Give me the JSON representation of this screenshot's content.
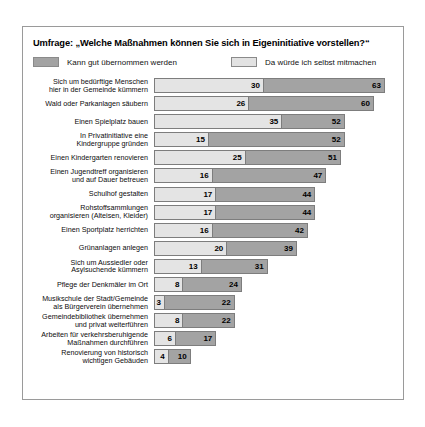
{
  "chart": {
    "title": "Umfrage: „Welche Maßnahmen können Sie sich in Eigeninitiative vorstellen?“",
    "legend": [
      {
        "label": "Kann gut übernommen werden",
        "swatch": "dark",
        "color": "#a3a3a3"
      },
      {
        "label": "Da würde ich selbst mitmachen",
        "swatch": "light",
        "color": "#e4e4e4"
      }
    ]
  },
  "chart_data": {
    "type": "bar",
    "orientation": "horizontal",
    "overlay": true,
    "title": "Umfrage: „Welche Maßnahmen können Sie sich in Eigeninitiative vorstellen?“",
    "xlabel": "",
    "ylabel": "",
    "xlim": [
      0,
      63
    ],
    "grid": false,
    "legend_position": "top",
    "categories": [
      "Sich um bedürftige Menschen hier in der Gemeinde kümmern",
      "Wald oder Parkanlagen säubern",
      "Einen Spielplatz bauen",
      "In Privatinitiative eine Kindergruppe gründen",
      "Einen Kindergarten renovieren",
      "Einen Jugendtreff organisieren und auf Dauer betreuen",
      "Schulhof gestalten",
      "Rohstoffsammlungen organisieren (Alteisen, Kleider)",
      "Einen Sportplatz herrichten",
      "Grünanlagen anlegen",
      "Sich um Aussiedler oder Asylsuchende kümmern",
      "Pflege der Denkmäler im Ort",
      "Musikschule der Stadt/Gemeinde als Bürgerverein übernehmen",
      "Gemeindebibliothek übernehmen und privat weiterführen",
      "Arbeiten für verkehrsberuhigende Maßnahmen durchführen",
      "Renovierung von historisch wichtigen Gebäuden"
    ],
    "series": [
      {
        "name": "Kann gut übernommen werden",
        "color": "#a3a3a3",
        "values": [
          63,
          60,
          52,
          52,
          51,
          47,
          44,
          44,
          42,
          39,
          31,
          24,
          22,
          22,
          17,
          10
        ]
      },
      {
        "name": "Da würde ich selbst mitmachen",
        "color": "#e4e4e4",
        "values": [
          30,
          26,
          35,
          15,
          25,
          16,
          17,
          17,
          16,
          20,
          13,
          8,
          3,
          8,
          6,
          4
        ]
      }
    ],
    "rows": [
      {
        "label_lines": [
          "Sich um bedürftige Menschen",
          "hier in der Gemeinde kümmern"
        ],
        "inner": 30,
        "outer": 63
      },
      {
        "label_lines": [
          "Wald oder Parkanlagen säubern"
        ],
        "inner": 26,
        "outer": 60
      },
      {
        "label_lines": [
          "Einen Spielplatz bauen"
        ],
        "inner": 35,
        "outer": 52
      },
      {
        "label_lines": [
          "In Privatinitiative eine",
          "Kindergruppe gründen"
        ],
        "inner": 15,
        "outer": 52
      },
      {
        "label_lines": [
          "Einen Kindergarten renovieren"
        ],
        "inner": 25,
        "outer": 51
      },
      {
        "label_lines": [
          "Einen Jugendtreff organisieren",
          "und auf Dauer betreuen"
        ],
        "inner": 16,
        "outer": 47
      },
      {
        "label_lines": [
          "Schulhof gestalten"
        ],
        "inner": 17,
        "outer": 44
      },
      {
        "label_lines": [
          "Rohstoffsammlungen",
          "organisieren (Alteisen, Kleider)"
        ],
        "inner": 17,
        "outer": 44
      },
      {
        "label_lines": [
          "Einen Sportplatz herrichten"
        ],
        "inner": 16,
        "outer": 42
      },
      {
        "label_lines": [
          "Grünanlagen anlegen"
        ],
        "inner": 20,
        "outer": 39
      },
      {
        "label_lines": [
          "Sich um Aussiedler oder",
          "Asylsuchende kümmern"
        ],
        "inner": 13,
        "outer": 31
      },
      {
        "label_lines": [
          "Pflege der Denkmäler im Ort"
        ],
        "inner": 8,
        "outer": 24
      },
      {
        "label_lines": [
          "Musikschule der Stadt/Gemeinde",
          "als Bürgerverein übernehmen"
        ],
        "inner": 3,
        "outer": 22
      },
      {
        "label_lines": [
          "Gemeindebibliothek übernehmen",
          "und privat weiterführen"
        ],
        "inner": 8,
        "outer": 22
      },
      {
        "label_lines": [
          "Arbeiten für verkehrsberuhigende",
          "Maßnahmen durchführen"
        ],
        "inner": 6,
        "outer": 17
      },
      {
        "label_lines": [
          "Renovierung von historisch",
          "wichtigen Gebäuden"
        ],
        "inner": 4,
        "outer": 10
      }
    ]
  }
}
